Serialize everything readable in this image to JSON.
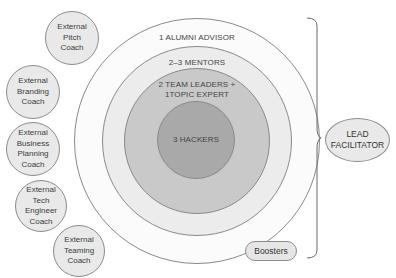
{
  "rings": [
    {
      "label": "1 ALUMNI ADVISOR",
      "color": "#fbfbfb"
    },
    {
      "label": "2–3 MENTORS",
      "color": "#ececec"
    },
    {
      "label": "2 TEAM LEADERS +\n1TOPIC EXPERT",
      "line1": "2 TEAM LEADERS +",
      "line2": "1TOPIC EXPERT",
      "color": "#c9c9c9"
    },
    {
      "label": "3 HACKERS",
      "color": "#a9a9a9"
    }
  ],
  "coaches": [
    {
      "label": "External\nPitch\nCoach"
    },
    {
      "label": "External\nBranding\nCoach"
    },
    {
      "label": "External\nBusiness\nPlanning\nCoach"
    },
    {
      "label": "External\nTech\nEngineer\nCoach"
    },
    {
      "label": "External\nTeaming\nCoach"
    }
  ],
  "boosters": {
    "label": "Boosters"
  },
  "lead": {
    "label": "LEAD\nFACILITATOR"
  }
}
